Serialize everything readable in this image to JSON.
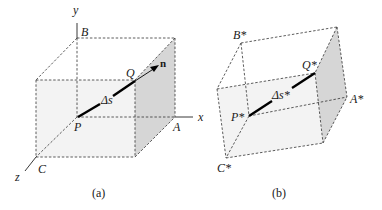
{
  "figure_a": {
    "caption": "(a)",
    "axes": {
      "x": "x",
      "y": "y",
      "z": "z"
    },
    "points": {
      "B": "B",
      "Q": "Q",
      "P": "P",
      "A": "A",
      "C": "C"
    },
    "segment_label": "Δs",
    "normal_label": "n"
  },
  "figure_b": {
    "caption": "(b)",
    "points": {
      "B": "B*",
      "Q": "Q*",
      "P": "P*",
      "A": "A*",
      "C": "C*"
    },
    "segment_label": "Δs*"
  },
  "colors": {
    "front_face": "#f3f3f3",
    "side_face": "#d6d6d6",
    "lines": "#333333"
  }
}
